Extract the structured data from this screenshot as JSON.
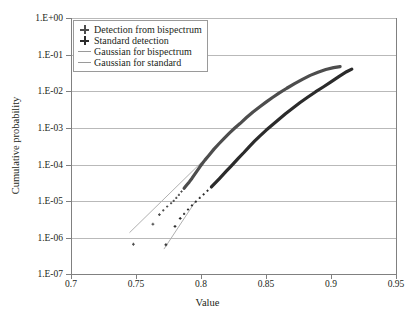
{
  "chart_data": {
    "type": "line",
    "title": "",
    "xlabel": "Value",
    "ylabel": "Cumulative probability",
    "xlim": [
      0.7,
      0.95
    ],
    "ylim": [
      1e-07,
      1.0
    ],
    "yscale": "log",
    "grid": true,
    "legend_position": "top-left",
    "x_ticks": [
      "0.7",
      "0.75",
      "0.8",
      "0.85",
      "0.9",
      "0.95"
    ],
    "x_tick_values": [
      0.7,
      0.75,
      0.8,
      0.85,
      0.9,
      0.95
    ],
    "y_ticks": [
      "1.E+00",
      "1.E-01",
      "1.E-02",
      "1.E-03",
      "1.E-04",
      "1.E-05",
      "1.E-06",
      "1.E-07"
    ],
    "y_tick_values": [
      1,
      0.1,
      0.01,
      0.001,
      0.0001,
      1e-05,
      1e-06,
      1e-07
    ],
    "series": [
      {
        "name": "Detection from bispectrum",
        "marker": "plus",
        "color": "#4d4d4d",
        "x": [
          0.748,
          0.763,
          0.768,
          0.771,
          0.774,
          0.777,
          0.779,
          0.781,
          0.783,
          0.785,
          0.787,
          0.789,
          0.791,
          0.793,
          0.795,
          0.797,
          0.799,
          0.801,
          0.803,
          0.806,
          0.81,
          0.814,
          0.818,
          0.822,
          0.826,
          0.83,
          0.835,
          0.84,
          0.845,
          0.85,
          0.855,
          0.86,
          0.866,
          0.872,
          0.878,
          0.884,
          0.89,
          0.896,
          0.902,
          0.907
        ],
        "y": [
          6.5e-07,
          2.3e-06,
          4.2e-06,
          5.5e-06,
          7e-06,
          8.6e-06,
          1e-05,
          1.2e-05,
          1.45e-05,
          1.8e-05,
          2.2e-05,
          2.7e-05,
          3.3e-05,
          4.1e-05,
          5.2e-05,
          6.6e-05,
          8.4e-05,
          0.000105,
          0.00013,
          0.000175,
          0.00026,
          0.00037,
          0.00052,
          0.00072,
          0.00098,
          0.0013,
          0.0019,
          0.0027,
          0.0037,
          0.005,
          0.0067,
          0.0088,
          0.012,
          0.016,
          0.021,
          0.027,
          0.033,
          0.039,
          0.044,
          0.047
        ]
      },
      {
        "name": "Standard detection",
        "marker": "plus",
        "color": "#2b2b2b",
        "x": [
          0.773,
          0.78,
          0.784,
          0.787,
          0.79,
          0.793,
          0.796,
          0.799,
          0.802,
          0.805,
          0.808,
          0.811,
          0.814,
          0.817,
          0.82,
          0.823,
          0.826,
          0.829,
          0.833,
          0.837,
          0.841,
          0.845,
          0.85,
          0.855,
          0.86,
          0.865,
          0.87,
          0.876,
          0.882,
          0.888,
          0.894,
          0.9,
          0.906,
          0.912,
          0.916
        ],
        "y": [
          6.3e-07,
          2e-06,
          3.3e-06,
          4.4e-06,
          5.8e-06,
          7.5e-06,
          9.5e-06,
          1.2e-05,
          1.5e-05,
          1.9e-05,
          2.4e-05,
          3.1e-05,
          4e-05,
          5.2e-05,
          6.8e-05,
          8.8e-05,
          0.000115,
          0.00015,
          0.00021,
          0.0003,
          0.00042,
          0.00058,
          0.00085,
          0.0012,
          0.0017,
          0.0024,
          0.0033,
          0.0048,
          0.0068,
          0.0095,
          0.013,
          0.018,
          0.025,
          0.034,
          0.04
        ]
      },
      {
        "name": "Gaussian for bispectrum",
        "marker": "line",
        "color": "#b0b0b0",
        "x": [
          0.745,
          0.8
        ],
        "y": [
          1.35e-06,
          0.00011
        ]
      },
      {
        "name": "Gaussian for standard",
        "marker": "line",
        "color": "#b0b0b0",
        "x": [
          0.7715,
          0.796
        ],
        "y": [
          4.8e-07,
          1e-05
        ]
      }
    ]
  },
  "legend": {
    "items": [
      {
        "label": "Detection from bispectrum",
        "key": "plus-marker-icon"
      },
      {
        "label": "Standard detection",
        "key": "plus-marker-icon"
      },
      {
        "label": "Gaussian for bispectrum",
        "key": "line-swatch-icon"
      },
      {
        "label": "Gaussian for standard",
        "key": "line-swatch-icon"
      }
    ]
  },
  "axes": {
    "x_title": "Value",
    "y_title": "Cumulative probability",
    "y_tick_labels": [
      "1.E+00",
      "1.E-01",
      "1.E-02",
      "1.E-03",
      "1.E-04",
      "1.E-05",
      "1.E-06",
      "1.E-07"
    ],
    "x_tick_labels": [
      "0.7",
      "0.75",
      "0.8",
      "0.85",
      "0.9",
      "0.95"
    ]
  },
  "colors": {
    "bispectrum": "#4d4d4d",
    "standard": "#2b2b2b",
    "gaussian": "#b0b0b0",
    "grid": "#b9b9b9",
    "axis": "#808080",
    "text": "#231f20",
    "background": "#ffffff"
  }
}
